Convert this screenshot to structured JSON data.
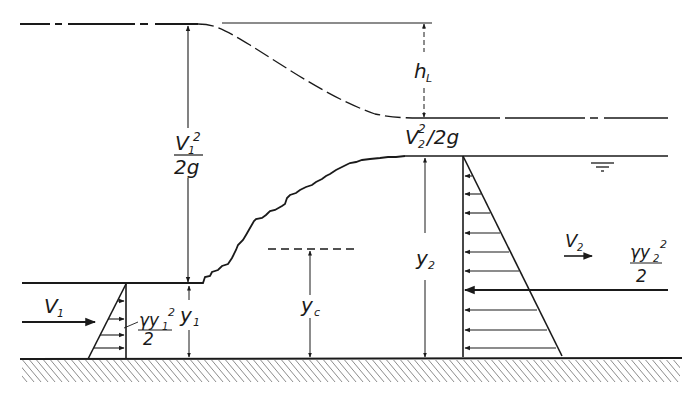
{
  "diagram": {
    "ink_color": "#1a1a1a",
    "background_color": "#ffffff",
    "labels": {
      "velocity_head_1_num": "V",
      "velocity_head_1_sub": "1",
      "velocity_head_1_sup": "2",
      "velocity_head_1_den": "2g",
      "head_loss": "h",
      "head_loss_sub": "L",
      "velocity_head_2": "V",
      "velocity_head_2_sub": "2",
      "velocity_head_2_rest": "/2g",
      "velocity_head_2_sup": "2",
      "depth_1": "y",
      "depth_1_sub": "1",
      "depth_2": "y",
      "depth_2_sub": "2",
      "critical_depth": "y",
      "critical_depth_sub": "c",
      "velocity_1": "V",
      "velocity_1_sub": "1",
      "velocity_2": "V",
      "velocity_2_sub": "2",
      "force_1_num": "γy",
      "force_1_sub": "1",
      "force_1_sup": "2",
      "force_1_den": "2",
      "force_2_num": "γy",
      "force_2_sub": "2",
      "force_2_sup": "2",
      "force_2_den": "2"
    },
    "elements": [
      "energy-grade-line",
      "water-surface-upstream",
      "water-surface-downstream",
      "hydraulic-jump-profile",
      "critical-depth-line",
      "channel-bed",
      "pressure-diagram-upstream",
      "pressure-diagram-downstream",
      "water-surface-symbol"
    ]
  }
}
